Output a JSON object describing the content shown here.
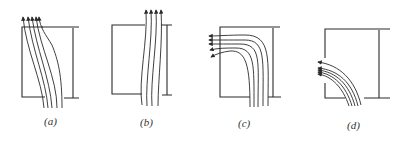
{
  "figure": {
    "panels": [
      {
        "id": "a",
        "label": "(a)",
        "description": "streamlines pass through the gap, bending slightly left at the exit"
      },
      {
        "id": "b",
        "label": "(b)",
        "description": "streamlines pass straight through the gap, nearly vertical"
      },
      {
        "id": "c",
        "label": "(c)",
        "description": "streamlines enter from below and turn left along the top wall"
      },
      {
        "id": "d",
        "label": "(d)",
        "description": "streamlines bend sharply left at the lower corner"
      }
    ],
    "stroke_color": "#2a2a2a",
    "background": "#ffffff"
  }
}
